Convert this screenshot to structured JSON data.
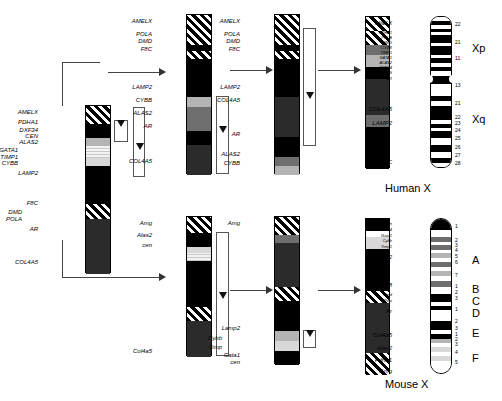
{
  "figure": {
    "captions": [
      {
        "text": "Human X",
        "x": 385,
        "y": 182
      },
      {
        "text": "Mouse X",
        "x": 385,
        "y": 378
      }
    ]
  },
  "panels": {
    "human_col1": {
      "name": "human-panel-1",
      "labels": [
        {
          "text": "AMELX",
          "x": 38,
          "y": 109
        },
        {
          "text": "PDHA1",
          "x": 38,
          "y": 119
        },
        {
          "text": "DXF34",
          "x": 38,
          "y": 127
        },
        {
          "text": "CEN",
          "x": 38,
          "y": 133
        },
        {
          "text": "ALAS2",
          "x": 38,
          "y": 139
        },
        {
          "text": "GATA1",
          "x": 18,
          "y": 147
        },
        {
          "text": "TIMP1",
          "x": 18,
          "y": 154
        },
        {
          "text": "CYBB",
          "x": 18,
          "y": 160
        },
        {
          "text": "LAMP2",
          "x": 38,
          "y": 170
        },
        {
          "text": "F8C",
          "x": 38,
          "y": 200
        },
        {
          "text": "DMD",
          "x": 22,
          "y": 209
        },
        {
          "text": "POLA",
          "x": 22,
          "y": 216
        },
        {
          "text": "AR",
          "x": 38,
          "y": 226
        },
        {
          "text": "COL4A5",
          "x": 38,
          "y": 259
        }
      ]
    },
    "human_col2": {
      "name": "human-panel-2",
      "labels": [
        {
          "text": "AMELX",
          "x": 152,
          "y": 18
        },
        {
          "text": "POLA",
          "x": 152,
          "y": 31
        },
        {
          "text": "DMD",
          "x": 152,
          "y": 38
        },
        {
          "text": "F8C",
          "x": 152,
          "y": 46
        },
        {
          "text": "LAMP2",
          "x": 152,
          "y": 84
        },
        {
          "text": "CYBB",
          "x": 152,
          "y": 97
        },
        {
          "text": "ALAS2",
          "x": 152,
          "y": 110
        },
        {
          "text": "AR",
          "x": 152,
          "y": 123
        },
        {
          "text": "COL4A5",
          "x": 152,
          "y": 158
        }
      ]
    },
    "human_col3": {
      "name": "human-panel-3",
      "labels": [
        {
          "text": "AMELX",
          "x": 240,
          "y": 18
        },
        {
          "text": "POLA",
          "x": 240,
          "y": 31
        },
        {
          "text": "DMD",
          "x": 240,
          "y": 38
        },
        {
          "text": "F8C",
          "x": 240,
          "y": 46
        },
        {
          "text": "LAMP2",
          "x": 240,
          "y": 84
        },
        {
          "text": "COL4A5",
          "x": 240,
          "y": 97
        },
        {
          "text": "AR",
          "x": 240,
          "y": 131
        },
        {
          "text": "ALAS2",
          "x": 240,
          "y": 151
        },
        {
          "text": "CYBB",
          "x": 240,
          "y": 160
        }
      ]
    },
    "mouse_col2": {
      "name": "mouse-panel-2",
      "labels": [
        {
          "text": "Amg",
          "x": 152,
          "y": 220
        },
        {
          "text": "Alas2",
          "x": 152,
          "y": 232
        },
        {
          "text": "cen",
          "x": 152,
          "y": 242
        },
        {
          "text": "Col4a5",
          "x": 152,
          "y": 348
        }
      ]
    },
    "mouse_col3": {
      "name": "mouse-panel-3",
      "labels": [
        {
          "text": "Amg",
          "x": 240,
          "y": 220
        },
        {
          "text": "Lamp2",
          "x": 240,
          "y": 325
        },
        {
          "text": "Cybb",
          "x": 222,
          "y": 335
        },
        {
          "text": "Timp",
          "x": 222,
          "y": 344
        },
        {
          "text": "Gata1",
          "x": 240,
          "y": 352
        },
        {
          "text": "cen",
          "x": 240,
          "y": 359
        }
      ]
    },
    "human_final": {
      "name": "human-final-panel",
      "labels": [
        {
          "text": "AMELX",
          "x": 392,
          "y": 21,
          "size": 5
        },
        {
          "text": "PDHA1",
          "x": 392,
          "y": 31,
          "size": 4
        },
        {
          "text": "POLA",
          "x": 392,
          "y": 36,
          "size": 4
        },
        {
          "text": "DMD",
          "x": 392,
          "y": 41,
          "size": 4
        },
        {
          "text": "CYBB",
          "x": 392,
          "y": 46,
          "size": 4
        },
        {
          "text": "TIMP1",
          "x": 392,
          "y": 51,
          "size": 4
        },
        {
          "text": "GATA1",
          "x": 392,
          "y": 56,
          "size": 4
        },
        {
          "text": "ALAS2",
          "x": 392,
          "y": 61,
          "size": 4
        },
        {
          "text": "DXF34",
          "x": 392,
          "y": 66,
          "size": 4
        },
        {
          "text": "CEN",
          "x": 392,
          "y": 71,
          "size": 4
        },
        {
          "text": "AR",
          "x": 392,
          "y": 77,
          "size": 4
        },
        {
          "text": "COL4A5",
          "x": 392,
          "y": 106,
          "size": 6
        },
        {
          "text": "LAMP2",
          "x": 392,
          "y": 120,
          "size": 6
        },
        {
          "text": "F8C",
          "x": 392,
          "y": 159,
          "size": 6
        }
      ],
      "arms": [
        {
          "text": "Xp",
          "x": 472,
          "y": 42
        },
        {
          "text": "Xq",
          "x": 472,
          "y": 113
        }
      ],
      "band_numbers": [
        {
          "text": "22",
          "y": 22
        },
        {
          "text": "21",
          "y": 40
        },
        {
          "text": "11",
          "y": 56
        },
        {
          "text": "13",
          "y": 83
        },
        {
          "text": "21",
          "y": 101
        },
        {
          "text": "22",
          "y": 115
        },
        {
          "text": "23",
          "y": 121
        },
        {
          "text": "24",
          "y": 128
        },
        {
          "text": "25",
          "y": 136
        },
        {
          "text": "26",
          "y": 145
        },
        {
          "text": "27",
          "y": 153
        },
        {
          "text": "28",
          "y": 161
        }
      ]
    },
    "mouse_final": {
      "name": "mouse-final-panel",
      "labels": [
        {
          "text": "cen",
          "x": 392,
          "y": 222,
          "size": 4
        },
        {
          "text": "DXF34",
          "x": 392,
          "y": 228,
          "size": 4
        },
        {
          "text": "Gata1",
          "x": 392,
          "y": 234,
          "size": 4
        },
        {
          "text": "Cybb",
          "x": 392,
          "y": 239,
          "size": 4
        },
        {
          "text": "Timp1",
          "x": 392,
          "y": 245,
          "size": 4
        },
        {
          "text": "Lamp2",
          "x": 392,
          "y": 254,
          "size": 6
        },
        {
          "text": "Cf-8",
          "x": 392,
          "y": 282,
          "size": 6
        },
        {
          "text": "Dmd",
          "x": 392,
          "y": 293,
          "size": 4
        },
        {
          "text": "Pola",
          "x": 392,
          "y": 299,
          "size": 4
        },
        {
          "text": "Ar",
          "x": 392,
          "y": 308,
          "size": 6
        },
        {
          "text": "Col4a5",
          "x": 392,
          "y": 332,
          "size": 6
        },
        {
          "text": "Alas2",
          "x": 392,
          "y": 345,
          "size": 6
        },
        {
          "text": "Pdha1",
          "x": 392,
          "y": 357,
          "size": 6
        },
        {
          "text": "Amg",
          "x": 392,
          "y": 368,
          "size": 6
        }
      ],
      "arms": [
        {
          "text": "A",
          "x": 472,
          "y": 254
        },
        {
          "text": "B",
          "x": 472,
          "y": 283
        },
        {
          "text": "C",
          "x": 472,
          "y": 295
        },
        {
          "text": "D",
          "x": 472,
          "y": 307
        },
        {
          "text": "E",
          "x": 472,
          "y": 327
        },
        {
          "text": "F",
          "x": 472,
          "y": 352
        }
      ],
      "band_numbers": [
        {
          "text": "1",
          "y": 224
        },
        {
          "text": "2",
          "y": 238
        },
        {
          "text": "3",
          "y": 243
        },
        {
          "text": "4",
          "y": 248
        },
        {
          "text": "5",
          "y": 254
        },
        {
          "text": "6",
          "y": 260
        },
        {
          "text": "7",
          "y": 273
        },
        {
          "text": "1",
          "y": 284
        },
        {
          "text": "2",
          "y": 290
        },
        {
          "text": "3",
          "y": 296
        },
        {
          "text": "1",
          "y": 307
        },
        {
          "text": "2",
          "y": 319
        },
        {
          "text": "3",
          "y": 326
        },
        {
          "text": "1",
          "y": 332
        },
        {
          "text": "2",
          "y": 337
        },
        {
          "text": "3",
          "y": 342
        },
        {
          "text": "4",
          "y": 350
        },
        {
          "text": "5",
          "y": 360
        }
      ]
    }
  }
}
